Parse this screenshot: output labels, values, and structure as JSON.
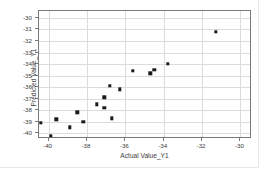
{
  "chart_data": {
    "type": "scatter",
    "title": "",
    "xlabel": "Actual Value_Y1",
    "ylabel": "Predicted Value_Y1",
    "xlim": [
      -40.5,
      -29.4
    ],
    "ylim": [
      -40.5,
      -29.4
    ],
    "xticks": [
      -40,
      -38,
      -36,
      -34,
      -32,
      -30
    ],
    "yticks": [
      -30,
      -31,
      -32,
      -33,
      -34,
      -35,
      -36,
      -37,
      -38,
      -39,
      -40
    ],
    "xticklabels": [
      "-40",
      "-38",
      "-36",
      "-34",
      "-32",
      "-30"
    ],
    "yticklabels": [
      "-30",
      "-31",
      "-32",
      "-33",
      "-34",
      "-35",
      "-36",
      "-37",
      "-38",
      "-39",
      "-40"
    ],
    "grid": true,
    "legend": null,
    "marker_color": "#1a1a1a",
    "marker_shape": "square",
    "series": [
      {
        "name": "Predicted vs Actual",
        "points": [
          {
            "x": -40.4,
            "y": -39.1
          },
          {
            "x": -39.9,
            "y": -40.2
          },
          {
            "x": -39.6,
            "y": -38.8
          },
          {
            "x": -38.9,
            "y": -39.5
          },
          {
            "x": -38.5,
            "y": -38.2
          },
          {
            "x": -38.2,
            "y": -39.0
          },
          {
            "x": -37.5,
            "y": -37.5
          },
          {
            "x": -37.1,
            "y": -37.8
          },
          {
            "x": -37.1,
            "y": -36.9
          },
          {
            "x": -36.8,
            "y": -35.9
          },
          {
            "x": -36.7,
            "y": -38.7
          },
          {
            "x": -36.3,
            "y": -36.2
          },
          {
            "x": -35.6,
            "y": -34.6
          },
          {
            "x": -34.7,
            "y": -34.8
          },
          {
            "x": -34.5,
            "y": -34.5
          },
          {
            "x": -33.8,
            "y": -34.0
          },
          {
            "x": -31.3,
            "y": -31.2
          }
        ]
      }
    ]
  }
}
